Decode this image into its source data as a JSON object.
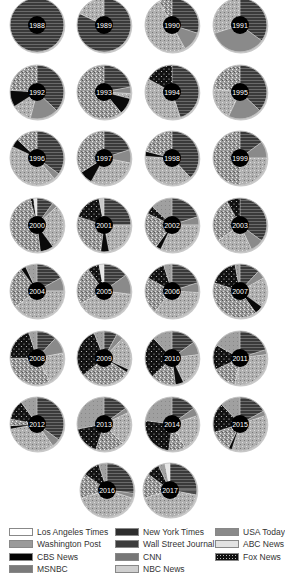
{
  "chart_data": {
    "type": "pie",
    "title": "",
    "legend_position": "bottom",
    "legend": [
      {
        "key": "LAT",
        "label": "Los Angeles Times",
        "pattern": "white"
      },
      {
        "key": "NYT",
        "label": "New York Times",
        "pattern": "stripes"
      },
      {
        "key": "USA",
        "label": "USA Today",
        "pattern": "gray"
      },
      {
        "key": "WP",
        "label": "Washington Post",
        "pattern": "dots-light"
      },
      {
        "key": "WSJ",
        "label": "Wall Street Journal",
        "pattern": "darkgray"
      },
      {
        "key": "ABC",
        "label": "ABC News",
        "pattern": "lightgray"
      },
      {
        "key": "CBS",
        "label": "CBS News",
        "pattern": "black"
      },
      {
        "key": "CNN",
        "label": "CNN",
        "pattern": "speckle"
      },
      {
        "key": "FOX",
        "label": "Fox News",
        "pattern": "blackdots"
      },
      {
        "key": "MSNBC",
        "label": "MSNBC",
        "pattern": "graytex"
      },
      {
        "key": "NBC",
        "label": "NBC News",
        "pattern": "lightgray2"
      }
    ],
    "pies": [
      {
        "year": "1988",
        "slices": [
          [
            "NYT",
            100
          ]
        ]
      },
      {
        "year": "1989",
        "slices": [
          [
            "NYT",
            82
          ],
          [
            "WP",
            18
          ]
        ]
      },
      {
        "year": "1990",
        "slices": [
          [
            "NYT",
            30
          ],
          [
            "USA",
            12
          ],
          [
            "WP",
            50
          ],
          [
            "CNN",
            8
          ]
        ]
      },
      {
        "year": "1991",
        "slices": [
          [
            "NYT",
            35
          ],
          [
            "USA",
            35
          ],
          [
            "WP",
            30
          ]
        ]
      },
      {
        "year": "1992",
        "slices": [
          [
            "NYT",
            37
          ],
          [
            "USA",
            17
          ],
          [
            "WP",
            12
          ],
          [
            "CBS",
            10
          ],
          [
            "CNN",
            24
          ]
        ]
      },
      {
        "year": "1993",
        "slices": [
          [
            "NYT",
            22
          ],
          [
            "USA",
            4
          ],
          [
            "WP",
            3
          ],
          [
            "CBS",
            10
          ],
          [
            "CNN",
            61
          ]
        ]
      },
      {
        "year": "1994",
        "slices": [
          [
            "NYT",
            45
          ],
          [
            "WP",
            38
          ],
          [
            "FOX",
            17
          ]
        ]
      },
      {
        "year": "1995",
        "slices": [
          [
            "NYT",
            37
          ],
          [
            "USA",
            20
          ],
          [
            "WP",
            20
          ],
          [
            "CNN",
            23
          ]
        ]
      },
      {
        "year": "1996",
        "slices": [
          [
            "NYT",
            35
          ],
          [
            "USA",
            4
          ],
          [
            "WP",
            43
          ],
          [
            "CBS",
            5
          ],
          [
            "CNN",
            13
          ]
        ]
      },
      {
        "year": "1997",
        "slices": [
          [
            "NYT",
            20
          ],
          [
            "USA",
            8
          ],
          [
            "WP",
            30
          ],
          [
            "CBS",
            8
          ],
          [
            "CNN",
            34
          ]
        ]
      },
      {
        "year": "1998",
        "slices": [
          [
            "NYT",
            38
          ],
          [
            "WP",
            38
          ],
          [
            "CBS",
            3
          ],
          [
            "CNN",
            21
          ]
        ]
      },
      {
        "year": "1999",
        "slices": [
          [
            "NYT",
            15
          ],
          [
            "USA",
            10
          ],
          [
            "WP",
            25
          ],
          [
            "CNN",
            50
          ]
        ]
      },
      {
        "year": "2000",
        "slices": [
          [
            "NYT",
            10
          ],
          [
            "USA",
            3
          ],
          [
            "WP",
            27
          ],
          [
            "CBS",
            8
          ],
          [
            "CNN",
            48
          ],
          [
            "FOX",
            2
          ],
          [
            "ABC",
            2
          ]
        ]
      },
      {
        "year": "2001",
        "slices": [
          [
            "NYT",
            25
          ],
          [
            "WP",
            22
          ],
          [
            "CBS",
            5
          ],
          [
            "CNN",
            28
          ],
          [
            "FOX",
            17
          ],
          [
            "NBC",
            3
          ]
        ]
      },
      {
        "year": "2002",
        "slices": [
          [
            "NYT",
            20
          ],
          [
            "USA",
            5
          ],
          [
            "WP",
            32
          ],
          [
            "CBS",
            3
          ],
          [
            "CNN",
            22
          ],
          [
            "FOX",
            5
          ],
          [
            "MSNBC",
            13
          ]
        ]
      },
      {
        "year": "2003",
        "slices": [
          [
            "NYT",
            35
          ],
          [
            "USA",
            8
          ],
          [
            "WP",
            22
          ],
          [
            "CNN",
            27
          ],
          [
            "FOX",
            8
          ]
        ]
      },
      {
        "year": "2004",
        "slices": [
          [
            "NYT",
            17
          ],
          [
            "USA",
            8
          ],
          [
            "WP",
            40
          ],
          [
            "CNN",
            25
          ],
          [
            "CBS",
            3
          ],
          [
            "MSNBC",
            7
          ]
        ]
      },
      {
        "year": "2005",
        "slices": [
          [
            "NYT",
            15
          ],
          [
            "USA",
            12
          ],
          [
            "WP",
            40
          ],
          [
            "CNN",
            23
          ],
          [
            "FOX",
            7
          ],
          [
            "ABC",
            3
          ]
        ]
      },
      {
        "year": "2006",
        "slices": [
          [
            "NYT",
            20
          ],
          [
            "USA",
            6
          ],
          [
            "WP",
            35
          ],
          [
            "CNN",
            22
          ],
          [
            "FOX",
            12
          ],
          [
            "MSNBC",
            5
          ]
        ]
      },
      {
        "year": "2007",
        "slices": [
          [
            "NYT",
            12
          ],
          [
            "USA",
            5
          ],
          [
            "WP",
            18
          ],
          [
            "CBS",
            5
          ],
          [
            "CNN",
            40
          ],
          [
            "FOX",
            17
          ],
          [
            "MSNBC",
            3
          ]
        ]
      },
      {
        "year": "2008",
        "slices": [
          [
            "NYT",
            12
          ],
          [
            "USA",
            10
          ],
          [
            "WP",
            20
          ],
          [
            "CNN",
            33
          ],
          [
            "FOX",
            20
          ],
          [
            "MSNBC",
            5
          ]
        ]
      },
      {
        "year": "2009",
        "slices": [
          [
            "NYT",
            8
          ],
          [
            "USA",
            4
          ],
          [
            "WP",
            20
          ],
          [
            "CBS",
            2
          ],
          [
            "CNN",
            30
          ],
          [
            "FOX",
            30
          ],
          [
            "MSNBC",
            6
          ]
        ]
      },
      {
        "year": "2010",
        "slices": [
          [
            "NYT",
            15
          ],
          [
            "USA",
            8
          ],
          [
            "WP",
            20
          ],
          [
            "CBS",
            5
          ],
          [
            "CNN",
            15
          ],
          [
            "FOX",
            25
          ],
          [
            "MSNBC",
            12
          ]
        ]
      },
      {
        "year": "2011",
        "slices": [
          [
            "NYT",
            20
          ],
          [
            "USA",
            3
          ],
          [
            "WP",
            30
          ],
          [
            "CNN",
            15
          ],
          [
            "FOX",
            15
          ],
          [
            "MSNBC",
            17
          ]
        ]
      },
      {
        "year": "2012",
        "slices": [
          [
            "NYT",
            35
          ],
          [
            "USA",
            5
          ],
          [
            "WP",
            32
          ],
          [
            "CBS",
            2
          ],
          [
            "CNN",
            4
          ],
          [
            "FOX",
            12
          ],
          [
            "MSNBC",
            10
          ]
        ]
      },
      {
        "year": "2013",
        "slices": [
          [
            "NYT",
            15
          ],
          [
            "USA",
            3
          ],
          [
            "WP",
            20
          ],
          [
            "CNN",
            17
          ],
          [
            "FOX",
            17
          ],
          [
            "MSNBC",
            28
          ]
        ]
      },
      {
        "year": "2014",
        "slices": [
          [
            "NYT",
            15
          ],
          [
            "USA",
            5
          ],
          [
            "WP",
            22
          ],
          [
            "CNN",
            10
          ],
          [
            "FOX",
            25
          ],
          [
            "MSNBC",
            23
          ]
        ]
      },
      {
        "year": "2015",
        "slices": [
          [
            "NYT",
            17
          ],
          [
            "USA",
            3
          ],
          [
            "WP",
            35
          ],
          [
            "CBS",
            2
          ],
          [
            "CNN",
            13
          ],
          [
            "FOX",
            18
          ],
          [
            "MSNBC",
            12
          ]
        ]
      },
      {
        "year": "2016",
        "slices": [
          [
            "NYT",
            27
          ],
          [
            "USA",
            3
          ],
          [
            "WP",
            40
          ],
          [
            "CNN",
            15
          ],
          [
            "FOX",
            10
          ],
          [
            "MSNBC",
            5
          ]
        ]
      },
      {
        "year": "2017",
        "slices": [
          [
            "NYT",
            25
          ],
          [
            "WSJ",
            3
          ],
          [
            "WP",
            42
          ],
          [
            "CNN",
            15
          ],
          [
            "FOX",
            8
          ],
          [
            "MSNBC",
            4
          ],
          [
            "ABC",
            3
          ]
        ]
      }
    ]
  },
  "legend_items": [
    {
      "label": "Los Angeles Times",
      "key": "LAT"
    },
    {
      "label": "New York Times",
      "key": "NYT"
    },
    {
      "label": "USA Today",
      "key": "USA"
    },
    {
      "label": "Washington Post",
      "key": "WP"
    },
    {
      "label": "Wall Street Journal",
      "key": "WSJ"
    },
    {
      "label": "ABC News",
      "key": "ABC"
    },
    {
      "label": "CBS News",
      "key": "CBS"
    },
    {
      "label": "CNN",
      "key": "CNN"
    },
    {
      "label": "Fox News",
      "key": "FOX"
    },
    {
      "label": "MSNBC",
      "key": "MSNBC"
    },
    {
      "label": "NBC News",
      "key": "NBC"
    }
  ]
}
